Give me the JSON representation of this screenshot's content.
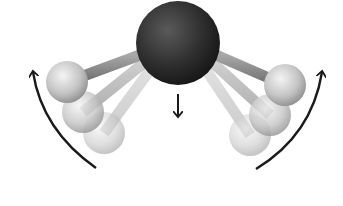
{
  "diagram": {
    "subject": "molecular bending vibration",
    "central_atom": {
      "label": "",
      "color": "#2a2a2a",
      "cx": 178,
      "cy": 43,
      "r": 42
    },
    "outer_atoms": {
      "left": [
        {
          "cx": 67,
          "cy": 82,
          "r": 21,
          "opacity": 1.0
        },
        {
          "cx": 83,
          "cy": 112,
          "r": 21,
          "opacity": 0.75
        },
        {
          "cx": 104,
          "cy": 133,
          "r": 21,
          "opacity": 0.5
        }
      ],
      "right": [
        {
          "cx": 285,
          "cy": 85,
          "r": 21,
          "opacity": 1.0
        },
        {
          "cx": 270,
          "cy": 115,
          "r": 21,
          "opacity": 0.75
        },
        {
          "cx": 250,
          "cy": 135,
          "r": 21,
          "opacity": 0.5
        }
      ],
      "color": "#c8c8c8"
    },
    "arrows": [
      {
        "name": "left-motion-arrow",
        "direction": "up"
      },
      {
        "name": "right-motion-arrow",
        "direction": "up"
      },
      {
        "name": "center-displacement-arrow",
        "direction": "down"
      }
    ],
    "colors": {
      "arrow": "#1a1a1a",
      "bond": "#8a8a8a",
      "background": "#ffffff"
    }
  }
}
